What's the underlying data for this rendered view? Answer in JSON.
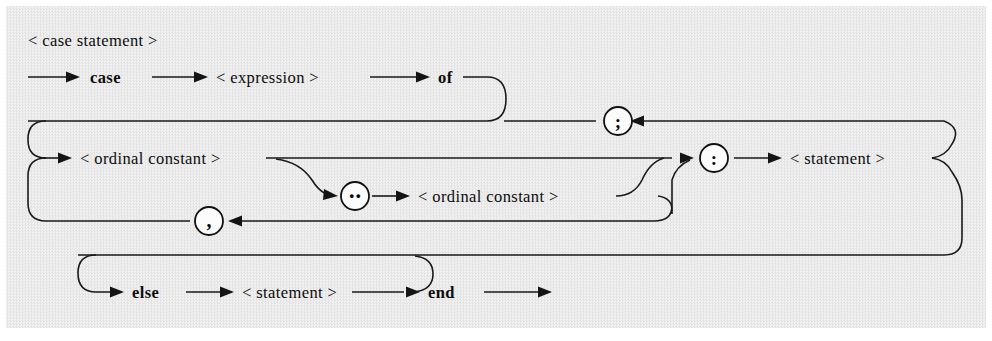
{
  "diagram": {
    "kind": "syntax-railroad-diagram",
    "title": "< case statement >",
    "background_color": "#eeeeee",
    "ink_color": "#141414",
    "nonterminals": {
      "expression": "< expression >",
      "ordinal_constant_1": "< ordinal constant >",
      "ordinal_constant_2": "< ordinal constant >",
      "statement_case": "< statement >",
      "statement_else": "< statement >"
    },
    "terminals": {
      "case": "case",
      "of": "of",
      "else": "else",
      "end": "end"
    },
    "token_circles": [
      {
        "name": "semicolon",
        "glyph": ";"
      },
      {
        "name": "colon",
        "glyph": ":"
      },
      {
        "name": "range",
        "glyph": "‥"
      },
      {
        "name": "comma",
        "glyph": ","
      }
    ],
    "rows": {
      "row1_label": "< case statement >",
      "row1_sequence": [
        "case",
        "< expression >",
        "of"
      ],
      "row2_sequence": [
        "< ordinal constant >",
        ":",
        "< statement >"
      ],
      "row3_sequence": [
        "‥",
        "< ordinal constant >"
      ],
      "row4_sequence": [
        "else",
        "< statement >",
        "end"
      ]
    }
  }
}
